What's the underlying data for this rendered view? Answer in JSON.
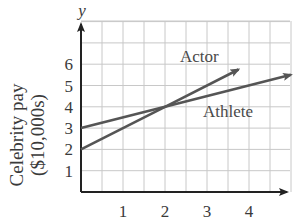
{
  "chart_data": {
    "type": "line",
    "title": "",
    "xlabel": "",
    "ylabel": "Celebrity pay ($10,000s)",
    "ylabel_lines": [
      "Celebrity pay",
      "($10,000s)"
    ],
    "y_axis_name": "y",
    "xlim": [
      0,
      5
    ],
    "ylim": [
      0,
      8
    ],
    "x_ticks": [
      1,
      2,
      3,
      4
    ],
    "y_ticks": [
      1,
      2,
      3,
      4,
      5,
      6
    ],
    "grid": true,
    "grid_step_x": 0.5,
    "grid_step_y": 1,
    "legend": "inline labels",
    "series": [
      {
        "name": "Actor",
        "label": "Actor",
        "x": [
          0,
          2,
          3.75
        ],
        "values": [
          2,
          4,
          5.75
        ],
        "slope": 1,
        "intercept": 2,
        "arrow": true
      },
      {
        "name": "Athlete",
        "label": "Athlete",
        "x": [
          0,
          2,
          5
        ],
        "values": [
          3,
          4,
          5.5
        ],
        "slope": 0.5,
        "intercept": 3,
        "arrow": true
      }
    ],
    "intersection": {
      "x": 2,
      "y": 4
    }
  },
  "colors": {
    "line": "#555555",
    "axis": "#222222",
    "grid": "#c8c8c8",
    "text": "#3a3a3a"
  },
  "labels": {
    "actor": "Actor",
    "athlete": "Athlete",
    "y_axis": "y",
    "ylabel_line1": "Celebrity pay",
    "ylabel_line2": "($10,000s)"
  }
}
